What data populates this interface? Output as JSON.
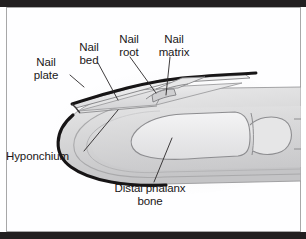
{
  "figure": {
    "type": "anatomical-cutaway-illustration",
    "style": "grayscale line and tone drawing",
    "border_color": "#221f20",
    "background_color": "#fefeff",
    "text_color": "#1a1718"
  },
  "labels": {
    "nail_plate": "Nail\nplate",
    "nail_bed": "Nail\nbed",
    "nail_root": "Nail\nroot",
    "nail_matrix": "Nail\nmatrix",
    "hyponchium": "Hyponchium",
    "distal_phalanx_bone": "Distal phalanx\nbone"
  },
  "structures": [
    {
      "name": "nail-plate",
      "description": "thin flat keratin sheet lying over the top of the fingertip"
    },
    {
      "name": "nail-bed",
      "description": "tissue layer directly beneath the nail plate"
    },
    {
      "name": "nail-root",
      "description": "proximal hidden portion of the nail under the skin fold"
    },
    {
      "name": "nail-matrix",
      "description": "growth zone at the base of the nail root"
    },
    {
      "name": "hyponchium",
      "description": "skin junction beneath the free distal edge of the nail"
    },
    {
      "name": "distal-phalanx-bone",
      "description": "terminal finger bone shown inside the fingertip"
    },
    {
      "name": "finger-soft-tissue",
      "description": "rounded pulp of the fingertip with layered tone shading"
    },
    {
      "name": "interphalangeal-joint",
      "description": "joint visible at the right where the finger continues"
    }
  ]
}
